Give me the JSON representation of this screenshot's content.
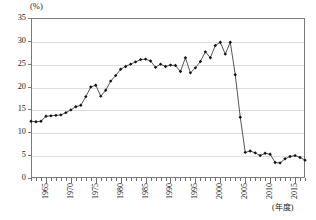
{
  "chart": {
    "unit_label": "(%)",
    "x_axis_title": "(年度)"
  },
  "chart_data": {
    "type": "line",
    "title": "",
    "subtitle": "",
    "xlabel": "(年度)",
    "ylabel": "(%)",
    "ylim": [
      0,
      35
    ],
    "xlim": [
      1962,
      2017
    ],
    "ytick_labels": [
      "0",
      "5",
      "10",
      "15",
      "20",
      "25",
      "30",
      "35"
    ],
    "ytick_values": [
      0,
      5,
      10,
      15,
      20,
      25,
      30,
      35
    ],
    "xtick_labels": [
      "1965",
      "1970",
      "1975",
      "1980",
      "1985",
      "1990",
      "1995",
      "2000",
      "2005",
      "2010",
      "2015"
    ],
    "xtick_values": [
      1965,
      1970,
      1975,
      1980,
      1985,
      1990,
      1995,
      2000,
      2005,
      2010,
      2015
    ],
    "grid": true,
    "legend": "none",
    "marker": "filled-diamond",
    "series": [
      {
        "name": "比率",
        "x": [
          1962,
          1963,
          1964,
          1965,
          1966,
          1967,
          1968,
          1969,
          1970,
          1971,
          1972,
          1973,
          1974,
          1975,
          1976,
          1977,
          1978,
          1979,
          1980,
          1981,
          1982,
          1983,
          1984,
          1985,
          1986,
          1987,
          1988,
          1989,
          1990,
          1991,
          1992,
          1993,
          1994,
          1995,
          1996,
          1997,
          1998,
          1999,
          2000,
          2001,
          2002,
          2003,
          2004,
          2005,
          2006,
          2007,
          2008,
          2009,
          2010,
          2011,
          2012,
          2013,
          2014,
          2015,
          2016,
          2017
        ],
        "values": [
          12.4,
          12.3,
          12.4,
          13.5,
          13.6,
          13.7,
          13.8,
          14.3,
          14.9,
          15.6,
          15.9,
          17.8,
          19.9,
          20.3,
          17.9,
          19.2,
          21.2,
          22.4,
          23.8,
          24.4,
          24.9,
          25.4,
          25.9,
          26.0,
          25.6,
          24.2,
          24.9,
          24.4,
          24.7,
          24.6,
          23.3,
          26.3,
          23.0,
          24.1,
          25.5,
          27.6,
          26.3,
          29.0,
          29.7,
          27.1,
          29.7,
          22.6,
          13.3,
          5.6,
          5.9,
          5.5,
          4.9,
          5.4,
          5.2,
          3.4,
          3.3,
          4.2,
          4.7,
          4.9,
          4.5,
          3.9
        ]
      }
    ]
  }
}
